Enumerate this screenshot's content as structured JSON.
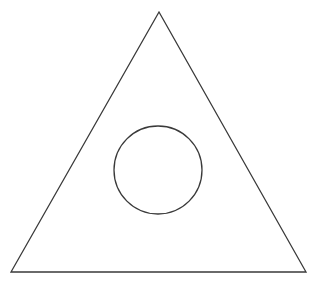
{
  "canvas": {
    "width": 315,
    "height": 286,
    "background_color": "#ffffff",
    "title": "Triangle with inscribed circle"
  },
  "style": {
    "stroke_color": "#3a3a3a",
    "stroke_width": 1.3,
    "fill": "none"
  },
  "figure": {
    "type": "line-drawing",
    "shapes": [
      {
        "name": "triangle",
        "kind": "polygon",
        "points": "159,12 306,272 11,272",
        "vertices": [
          {
            "label": "apex",
            "x": 159,
            "y": 12
          },
          {
            "label": "bottom-right",
            "x": 306,
            "y": 272
          },
          {
            "label": "bottom-left",
            "x": 11,
            "y": 272
          }
        ],
        "stroke_color": "#3a3a3a",
        "stroke_width": 1.3,
        "fill": "none"
      },
      {
        "name": "circle",
        "kind": "circle",
        "cx": 158,
        "cy": 170,
        "r": 44,
        "bounds": {
          "left": 114,
          "top": 126,
          "right": 202,
          "bottom": 214
        },
        "stroke_color": "#3a3a3a",
        "stroke_width": 1.3,
        "fill": "none"
      }
    ]
  },
  "chart_data": {
    "type": "scatter",
    "title": "",
    "xlabel": "",
    "ylabel": "",
    "xlim": [
      0,
      315
    ],
    "ylim": [
      0,
      286
    ],
    "grid": false,
    "legend": "none",
    "annotations": [],
    "series": [
      {
        "name": "triangle",
        "shape": "polygon",
        "closed": true,
        "x": [
          159,
          306,
          11
        ],
        "y": [
          12,
          272,
          272
        ]
      },
      {
        "name": "circle",
        "shape": "circle",
        "closed": true,
        "center_x": 158,
        "center_y": 170,
        "radius": 44
      }
    ]
  }
}
